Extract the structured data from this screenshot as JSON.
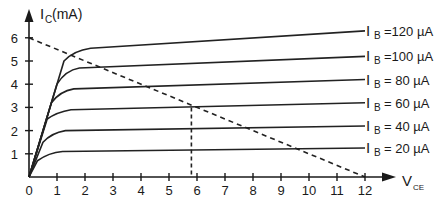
{
  "chart_data": {
    "type": "line",
    "title": "",
    "xlabel": "V_CE",
    "ylabel": "I_C(mA)",
    "xlim": [
      0,
      12
    ],
    "ylim": [
      0,
      6
    ],
    "x_ticks": [
      "0",
      "1",
      "2",
      "3",
      "4",
      "5",
      "6",
      "7",
      "8",
      "9",
      "10",
      "11",
      "12"
    ],
    "y_ticks": [
      "1",
      "2",
      "3",
      "4",
      "5",
      "6"
    ],
    "grid": false,
    "series": [
      {
        "name": "I_B = 20 µA",
        "label_left": "I",
        "label_sub": "B",
        "label_right": "= 20 µA",
        "points": [
          [
            0,
            0
          ],
          [
            0.3,
            0.7
          ],
          [
            0.7,
            1.05
          ],
          [
            1.2,
            1.1
          ],
          [
            12,
            1.25
          ]
        ]
      },
      {
        "name": "I_B = 40 µA",
        "label_left": "I",
        "label_sub": "B",
        "label_right": "= 40 µA",
        "points": [
          [
            0,
            0
          ],
          [
            0.5,
            1.5
          ],
          [
            0.8,
            1.9
          ],
          [
            1.3,
            2.0
          ],
          [
            12,
            2.2
          ]
        ]
      },
      {
        "name": "I_B = 60 µA",
        "label_left": "I",
        "label_sub": "B",
        "label_right": "= 60 µA",
        "points": [
          [
            0,
            0
          ],
          [
            0.65,
            2.5
          ],
          [
            1.0,
            2.8
          ],
          [
            1.5,
            2.9
          ],
          [
            12,
            3.2
          ]
        ]
      },
      {
        "name": "I_B = 80 µA",
        "label_left": "I",
        "label_sub": "B",
        "label_right": "= 80 µA",
        "points": [
          [
            0,
            0
          ],
          [
            0.8,
            3.2
          ],
          [
            1.1,
            3.7
          ],
          [
            1.6,
            3.8
          ],
          [
            12,
            4.2
          ]
        ]
      },
      {
        "name": "I_B = 100 µA",
        "label_left": "I",
        "label_sub": "B",
        "label_right": "=100 µA",
        "points": [
          [
            0,
            0
          ],
          [
            1.0,
            4.0
          ],
          [
            1.3,
            4.6
          ],
          [
            1.8,
            4.7
          ],
          [
            12,
            5.2
          ]
        ]
      },
      {
        "name": "I_B = 120 µA",
        "label_left": "I",
        "label_sub": "B",
        "label_right": "=120 µA",
        "points": [
          [
            0,
            0
          ],
          [
            1.25,
            5.0
          ],
          [
            1.6,
            5.45
          ],
          [
            2.2,
            5.55
          ],
          [
            12,
            6.3
          ]
        ]
      }
    ],
    "annotations": [
      {
        "type": "load-line",
        "style": "dashed",
        "from": [
          0,
          6
        ],
        "to": [
          12,
          0
        ]
      },
      {
        "type": "q-point-drop",
        "style": "dashed",
        "x": 5.8,
        "from_y": 3.0,
        "to_y": 0
      }
    ],
    "legend_position": "inline-right"
  },
  "axis": {
    "y_label_main": "I",
    "y_label_sub": "C",
    "y_label_unit": "(mA)",
    "x_label_main": "V",
    "x_label_sub": "CE"
  }
}
